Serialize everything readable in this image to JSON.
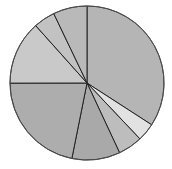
{
  "chart_data": {
    "type": "pie",
    "title": "",
    "start_angle_deg": 0,
    "direction": "clockwise",
    "center": [
      87,
      83
    ],
    "radius": 77,
    "slices": [
      {
        "label": "",
        "value": 34.1,
        "color": "#b5b5b5"
      },
      {
        "label": "",
        "value": 3.8,
        "color": "#e2e2e2"
      },
      {
        "label": "",
        "value": 5.1,
        "color": "#bdbdbd"
      },
      {
        "label": "",
        "value": 10.1,
        "color": "#a9a9a9"
      },
      {
        "label": "",
        "value": 21.8,
        "color": "#adadad"
      },
      {
        "label": "",
        "value": 13.4,
        "color": "#c9c9c9"
      },
      {
        "label": "",
        "value": 4.5,
        "color": "#c2c2c2"
      },
      {
        "label": "",
        "value": 7.1,
        "color": "#b9b9b9"
      }
    ],
    "stroke_color": "#222222",
    "legend": "none"
  }
}
